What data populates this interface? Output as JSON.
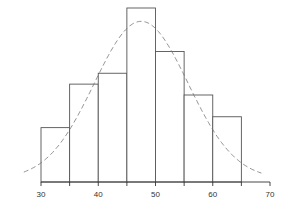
{
  "chart_data": {
    "type": "bar",
    "subtype": "histogram",
    "title": "",
    "xlabel": "",
    "ylabel": "",
    "bins": [
      [
        30,
        35
      ],
      [
        35,
        40
      ],
      [
        40,
        45
      ],
      [
        45,
        50
      ],
      [
        50,
        55
      ],
      [
        55,
        60
      ],
      [
        60,
        65
      ]
    ],
    "categories": [
      "30-35",
      "35-40",
      "40-45",
      "45-50",
      "50-55",
      "55-60",
      "60-65"
    ],
    "values": [
      5,
      9,
      10,
      16,
      12,
      8,
      6
    ],
    "xlim": [
      26,
      70
    ],
    "ylim": [
      0,
      16.5
    ],
    "x_ticks": [
      30,
      35,
      40,
      45,
      50,
      55,
      60,
      65,
      70
    ],
    "x_tick_labels": [
      "30",
      "40",
      "50",
      "60",
      "70"
    ],
    "overlay": {
      "type": "normal-curve",
      "style": "dashed",
      "mean": 47.5,
      "sd": 8.2,
      "peak": 14.5
    },
    "grid": false,
    "legend": null,
    "bar_fill": "#ffffff",
    "bar_stroke": "#555555",
    "curve_color": "#777777"
  }
}
